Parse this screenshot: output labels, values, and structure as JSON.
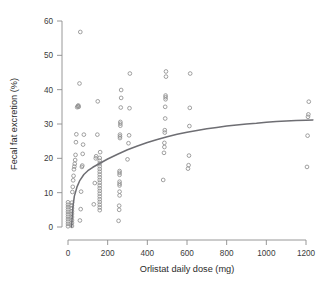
{
  "chart_data": {
    "type": "scatter",
    "title": "",
    "xlabel": "Orlistat daily dose (mg)",
    "ylabel": "Fecal fat excretion (%)",
    "xlim": [
      -40,
      1260
    ],
    "ylim": [
      -2,
      61
    ],
    "xticks": [
      0,
      200,
      400,
      600,
      800,
      1000,
      1200
    ],
    "xticklabels": [
      "0",
      "200",
      "400",
      "600",
      "800",
      "1000",
      "1200"
    ],
    "yticks": [
      0,
      10,
      20,
      30,
      40,
      50,
      60
    ],
    "yticklabels": [
      "0",
      "10",
      "20",
      "30",
      "40",
      "50",
      "60"
    ],
    "grid": false,
    "legend": null,
    "marker": "open-circle",
    "marker_color": "#8f8f8f",
    "curve_color": "#6e6e73",
    "points": [
      [
        0,
        0.2
      ],
      [
        0,
        0.9
      ],
      [
        0,
        1.6
      ],
      [
        0,
        2.3
      ],
      [
        0,
        3.0
      ],
      [
        0,
        3.7
      ],
      [
        0,
        4.4
      ],
      [
        0,
        5.1
      ],
      [
        0,
        5.8
      ],
      [
        0,
        6.5
      ],
      [
        0,
        7.2
      ],
      [
        20,
        0.3
      ],
      [
        20,
        1.2
      ],
      [
        20,
        2.0
      ],
      [
        20,
        2.9
      ],
      [
        20,
        3.8
      ],
      [
        20,
        4.6
      ],
      [
        20,
        5.5
      ],
      [
        20,
        6.3
      ],
      [
        20,
        7.1
      ],
      [
        22,
        10.2
      ],
      [
        24,
        11.7
      ],
      [
        26,
        13.6
      ],
      [
        28,
        14.9
      ],
      [
        30,
        16.8
      ],
      [
        32,
        17.6
      ],
      [
        34,
        18.4
      ],
      [
        36,
        19.5
      ],
      [
        38,
        21.0
      ],
      [
        40,
        24.7
      ],
      [
        42,
        27.0
      ],
      [
        46,
        34.9
      ],
      [
        50,
        35.2
      ],
      [
        52,
        35.4
      ],
      [
        54,
        35.0
      ],
      [
        58,
        41.8
      ],
      [
        62,
        56.8
      ],
      [
        60,
        1.9
      ],
      [
        64,
        5.2
      ],
      [
        66,
        10.3
      ],
      [
        70,
        17.5
      ],
      [
        72,
        17.9
      ],
      [
        74,
        21.3
      ],
      [
        76,
        24.0
      ],
      [
        80,
        26.9
      ],
      [
        130,
        6.6
      ],
      [
        135,
        12.8
      ],
      [
        140,
        20.0
      ],
      [
        142,
        20.6
      ],
      [
        148,
        26.9
      ],
      [
        150,
        36.6
      ],
      [
        160,
        4.9
      ],
      [
        160,
        5.7
      ],
      [
        160,
        6.5
      ],
      [
        160,
        7.3
      ],
      [
        160,
        8.1
      ],
      [
        160,
        8.9
      ],
      [
        160,
        9.7
      ],
      [
        160,
        10.5
      ],
      [
        160,
        11.3
      ],
      [
        160,
        12.1
      ],
      [
        160,
        12.9
      ],
      [
        160,
        13.7
      ],
      [
        160,
        14.5
      ],
      [
        160,
        15.3
      ],
      [
        160,
        16.1
      ],
      [
        160,
        16.9
      ],
      [
        160,
        17.7
      ],
      [
        160,
        18.5
      ],
      [
        160,
        19.3
      ],
      [
        160,
        20.1
      ],
      [
        162,
        21.8
      ],
      [
        255,
        1.8
      ],
      [
        258,
        5.0
      ],
      [
        258,
        6.2
      ],
      [
        260,
        9.2
      ],
      [
        260,
        10.3
      ],
      [
        260,
        12.1
      ],
      [
        260,
        12.6
      ],
      [
        260,
        13.2
      ],
      [
        260,
        15.2
      ],
      [
        260,
        15.8
      ],
      [
        260,
        16.3
      ],
      [
        262,
        25.9
      ],
      [
        262,
        26.4
      ],
      [
        262,
        26.9
      ],
      [
        264,
        29.5
      ],
      [
        264,
        30.1
      ],
      [
        264,
        30.6
      ],
      [
        266,
        34.8
      ],
      [
        268,
        37.6
      ],
      [
        268,
        39.9
      ],
      [
        300,
        19.7
      ],
      [
        305,
        24.4
      ],
      [
        308,
        26.7
      ],
      [
        310,
        34.6
      ],
      [
        312,
        44.7
      ],
      [
        480,
        13.7
      ],
      [
        484,
        21.6
      ],
      [
        486,
        23.3
      ],
      [
        486,
        24.5
      ],
      [
        488,
        27.5
      ],
      [
        488,
        28.2
      ],
      [
        490,
        31.6
      ],
      [
        490,
        35.0
      ],
      [
        492,
        37.2
      ],
      [
        492,
        37.8
      ],
      [
        492,
        38.3
      ],
      [
        494,
        43.8
      ],
      [
        494,
        45.3
      ],
      [
        605,
        17.0
      ],
      [
        608,
        18.0
      ],
      [
        610,
        20.8
      ],
      [
        612,
        29.4
      ],
      [
        614,
        34.7
      ],
      [
        616,
        44.7
      ],
      [
        1205,
        17.5
      ],
      [
        1208,
        26.6
      ],
      [
        1210,
        32.1
      ],
      [
        1212,
        32.8
      ],
      [
        1214,
        36.5
      ]
    ],
    "fit_curve": {
      "description": "Fitted dose-response curve (Emax style saturating fit)",
      "points": [
        [
          18,
          0.0
        ],
        [
          24,
          5.5
        ],
        [
          32,
          9.0
        ],
        [
          45,
          11.6
        ],
        [
          60,
          13.6
        ],
        [
          80,
          15.3
        ],
        [
          100,
          16.4
        ],
        [
          125,
          17.4
        ],
        [
          150,
          18.2
        ],
        [
          175,
          19.0
        ],
        [
          200,
          19.8
        ],
        [
          250,
          21.2
        ],
        [
          300,
          22.5
        ],
        [
          350,
          23.6
        ],
        [
          400,
          24.6
        ],
        [
          450,
          25.5
        ],
        [
          500,
          26.3
        ],
        [
          550,
          27.0
        ],
        [
          600,
          27.6
        ],
        [
          650,
          28.1
        ],
        [
          700,
          28.6
        ],
        [
          750,
          29.0
        ],
        [
          800,
          29.4
        ],
        [
          850,
          29.7
        ],
        [
          900,
          30.0
        ],
        [
          950,
          30.2
        ],
        [
          1000,
          30.5
        ],
        [
          1050,
          30.7
        ],
        [
          1100,
          30.9
        ],
        [
          1150,
          31.0
        ],
        [
          1200,
          31.1
        ],
        [
          1235,
          31.2
        ]
      ]
    }
  }
}
